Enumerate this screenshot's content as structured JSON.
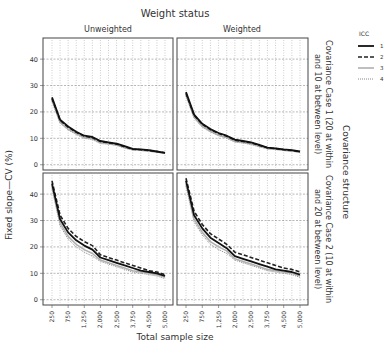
{
  "chart_data": {
    "type": "line",
    "title": "Weight status",
    "column_labels": [
      "Unweighted",
      "Weighted"
    ],
    "row_title": "Covariance structure",
    "row_labels": [
      [
        "Covariance Case 1 (20 at within",
        "and 10 at between level)"
      ],
      [
        "Covariance Case 2 (10 at within",
        "and 20 at between level)"
      ]
    ],
    "xlabel": "Total sample size",
    "ylabel": "Fixed slope—CV (%)",
    "x": [
      250,
      500,
      750,
      1000,
      1250,
      1500,
      2000,
      2250,
      2500,
      3000,
      3750,
      4000,
      4500,
      4750,
      5000
    ],
    "x_tick_labels": [
      "250",
      "750",
      "1,250",
      "2,000",
      "2,500",
      "3,750",
      "4,500",
      "5,000"
    ],
    "x_tick_indices": [
      0,
      2,
      4,
      6,
      8,
      10,
      12,
      14
    ],
    "yticks": [
      0,
      10,
      20,
      30,
      40
    ],
    "ylim": [
      -2,
      48
    ],
    "grid": true,
    "legend": {
      "title": "ICC",
      "position": "right",
      "entries": [
        {
          "label": "1",
          "style": "solid",
          "color": "#111111"
        },
        {
          "label": "2",
          "style": "dashed",
          "color": "#222222"
        },
        {
          "label": "3",
          "style": "solid-light",
          "color": "#aaaaaa"
        },
        {
          "label": "4",
          "style": "dotted",
          "color": "#888888"
        }
      ]
    },
    "panels": [
      {
        "row": 0,
        "col": 0,
        "column_label": "Unweighted",
        "row_label": "Covariance Case 1",
        "series": [
          {
            "name": "1",
            "values": [
              25.5,
              17.0,
              14.5,
              12.5,
              11.0,
              10.5,
              9.0,
              8.5,
              8.0,
              7.0,
              6.0,
              5.8,
              5.5,
              5.0,
              4.5
            ]
          },
          {
            "name": "2",
            "values": [
              25.0,
              16.8,
              14.2,
              12.3,
              10.8,
              10.2,
              8.8,
              8.3,
              7.8,
              6.8,
              5.9,
              5.7,
              5.4,
              5.0,
              4.5
            ]
          },
          {
            "name": "3",
            "values": [
              24.5,
              16.0,
              13.5,
              11.8,
              10.3,
              9.8,
              8.3,
              8.0,
              7.5,
              6.5,
              5.7,
              5.5,
              5.2,
              4.8,
              4.4
            ]
          },
          {
            "name": "4",
            "values": [
              24.0,
              15.8,
              13.2,
              11.5,
              10.0,
              9.5,
              8.0,
              7.8,
              7.3,
              6.3,
              5.6,
              5.4,
              5.1,
              4.7,
              4.3
            ]
          }
        ]
      },
      {
        "row": 0,
        "col": 1,
        "column_label": "Weighted",
        "row_label": "Covariance Case 1",
        "series": [
          {
            "name": "1",
            "values": [
              27.5,
              19.0,
              15.5,
              13.5,
              12.0,
              11.0,
              9.5,
              9.0,
              8.5,
              7.5,
              6.5,
              6.2,
              5.8,
              5.5,
              5.0
            ]
          },
          {
            "name": "2",
            "values": [
              27.0,
              18.7,
              15.3,
              13.3,
              11.8,
              10.8,
              9.3,
              8.8,
              8.3,
              7.3,
              6.4,
              6.1,
              5.7,
              5.4,
              4.9
            ]
          },
          {
            "name": "3",
            "values": [
              26.5,
              18.0,
              14.5,
              12.7,
              11.2,
              10.3,
              8.8,
              8.4,
              7.9,
              7.0,
              6.1,
              5.9,
              5.5,
              5.2,
              4.8
            ]
          },
          {
            "name": "4",
            "values": [
              26.0,
              17.7,
              14.2,
              12.4,
              11.0,
              10.0,
              8.6,
              8.2,
              7.7,
              6.8,
              6.0,
              5.8,
              5.4,
              5.1,
              4.7
            ]
          }
        ]
      },
      {
        "row": 1,
        "col": 0,
        "column_label": "Unweighted",
        "row_label": "Covariance Case 2",
        "series": [
          {
            "name": "1",
            "values": [
              44.0,
              30.5,
              25.5,
              22.5,
              20.5,
              19.0,
              16.0,
              15.0,
              14.0,
              13.0,
              12.0,
              11.0,
              10.5,
              10.0,
              9.0
            ]
          },
          {
            "name": "2",
            "values": [
              45.0,
              32.0,
              27.0,
              24.0,
              22.0,
              20.5,
              17.0,
              16.0,
              15.0,
              14.0,
              13.0,
              12.0,
              11.0,
              10.5,
              9.5
            ]
          },
          {
            "name": "3",
            "values": [
              43.0,
              29.0,
              24.0,
              21.0,
              19.0,
              17.5,
              15.0,
              14.0,
              13.0,
              12.0,
              11.0,
              10.5,
              10.0,
              9.5,
              8.5
            ]
          },
          {
            "name": "4",
            "values": [
              42.0,
              28.0,
              23.0,
              20.0,
              18.0,
              16.5,
              14.5,
              13.5,
              12.5,
              11.5,
              10.5,
              10.0,
              9.5,
              9.0,
              8.0
            ]
          }
        ]
      },
      {
        "row": 1,
        "col": 1,
        "column_label": "Weighted",
        "row_label": "Covariance Case 2",
        "series": [
          {
            "name": "1",
            "values": [
              45.0,
              32.0,
              27.0,
              23.5,
              21.5,
              19.5,
              16.5,
              15.5,
              14.5,
              13.5,
              12.5,
              11.5,
              11.0,
              10.5,
              9.5
            ]
          },
          {
            "name": "2",
            "values": [
              46.0,
              33.5,
              28.5,
              25.0,
              23.0,
              21.0,
              18.0,
              17.0,
              16.0,
              15.0,
              14.0,
              13.0,
              12.0,
              11.5,
              10.5
            ]
          },
          {
            "name": "3",
            "values": [
              44.0,
              30.5,
              25.5,
              22.0,
              20.0,
              18.5,
              15.5,
              14.5,
              13.5,
              12.5,
              11.5,
              11.0,
              10.5,
              10.0,
              9.0
            ]
          },
          {
            "name": "4",
            "values": [
              43.0,
              29.5,
              24.5,
              21.0,
              19.0,
              17.5,
              15.0,
              14.0,
              13.0,
              12.0,
              11.0,
              10.5,
              10.0,
              9.5,
              8.5
            ]
          }
        ]
      }
    ]
  }
}
